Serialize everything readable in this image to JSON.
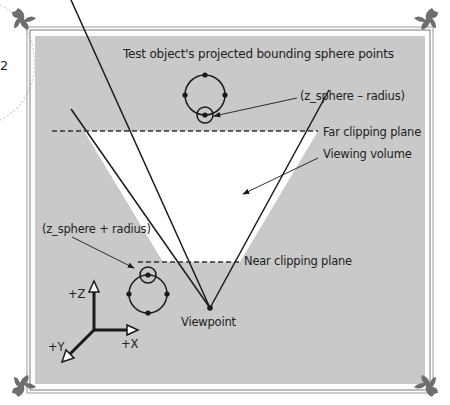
{
  "page": {
    "number_fragment": "2"
  },
  "figure": {
    "title": "Test object's projected bounding sphere points",
    "labels": {
      "far_minus": "(z_sphere – radius)",
      "far_clip": "Far clipping plane",
      "viewing_volume": "Viewing volume",
      "near_plus": "(z_sphere + radius)",
      "near_clip": "Near clipping plane",
      "viewpoint": "Viewpoint"
    },
    "axes": {
      "z": "+Z",
      "x": "+X",
      "y": "+Y"
    },
    "colors": {
      "panel": "#c9c9c9",
      "volume": "#ffffff",
      "line": "#1a1a1a",
      "frame": "#6e6e6e"
    }
  }
}
